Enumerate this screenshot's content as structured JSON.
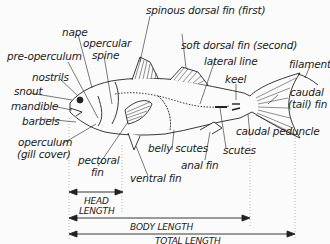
{
  "labels": {
    "spinous_dorsal_fin": "spinous dorsal fin (first)",
    "nape": "nape",
    "opercular_spine_1": "opercular",
    "opercular_spine_2": "spine",
    "soft_dorsal_fin": "soft dorsal fin (second)",
    "pre_operculum": "pre-operculum",
    "lateral_line": "lateral line",
    "filament": "filament",
    "nostrils": "nostrils",
    "keel": "keel",
    "snout": "snout",
    "caudal_fin_1": "caudal",
    "caudal_fin_2": "(tail) fin",
    "mandible": "mandible",
    "barbels": "barbels",
    "caudal_peduncle": "caudal peduncle",
    "operculum_1": "operculum",
    "operculum_2": "(gill cover)",
    "belly_scutes": "belly scutes",
    "scutes": "scutes",
    "anal_fin": "anal fin",
    "pectoral_fin_1": "pectoral",
    "pectoral_fin_2": "fin",
    "ventral_fin": "ventral fin"
  },
  "measurements": {
    "head_length_1": "HEAD",
    "head_length_2": "LENGTH",
    "body_length": "BODY LENGTH",
    "total_length": "TOTAL LENGTH"
  },
  "colors": {
    "background": "#fbfbfb",
    "ink": "#222222",
    "guide": "#888888"
  }
}
